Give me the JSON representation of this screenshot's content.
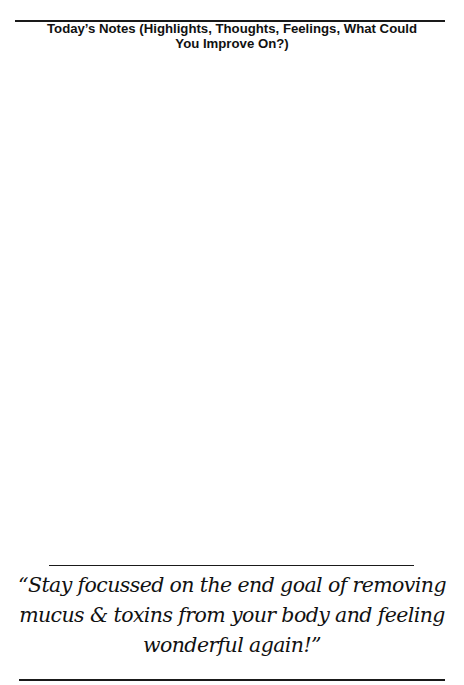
{
  "page": {
    "heading": {
      "line1": "Today’s Notes (Highlights, Thoughts, Feelings, What Could",
      "line2": "You Improve On?)"
    },
    "notes": {
      "content": ""
    },
    "quote": {
      "line1": "“Stay focussed on the end goal of removing",
      "line2": "mucus & toxins from your body and feeling",
      "line3": "wonderful again!”"
    }
  }
}
